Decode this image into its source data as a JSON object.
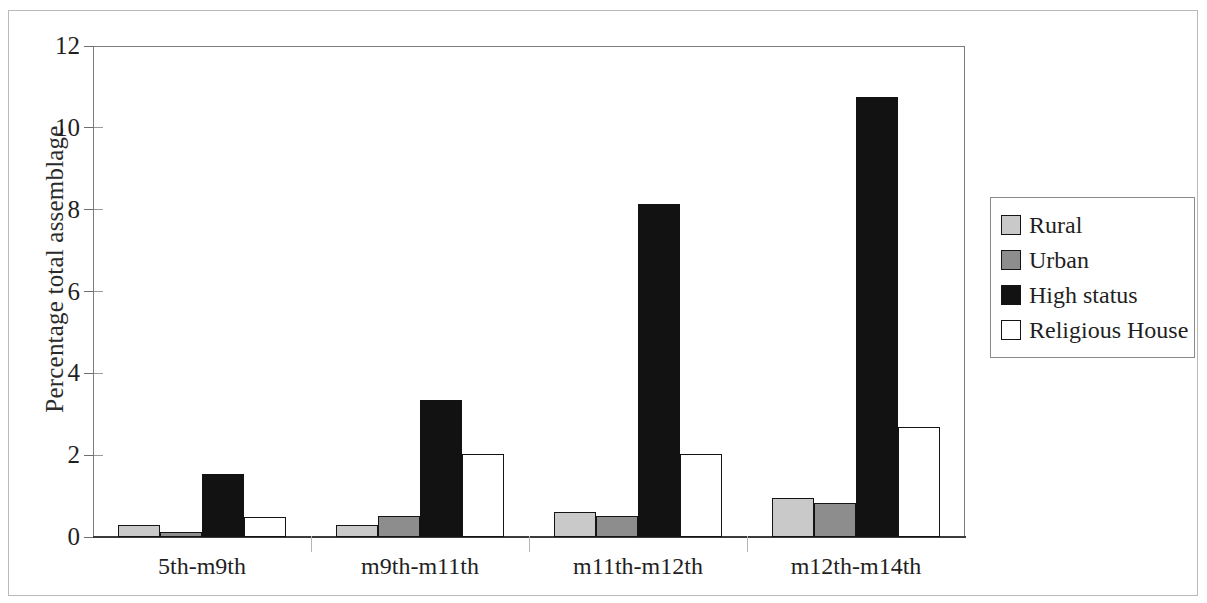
{
  "chart_data": {
    "type": "bar",
    "title": "",
    "subtitle": "",
    "xlabel": "",
    "ylabel": "Percentage total assemblage",
    "categories": [
      "5th-m9th",
      "m9th-m11th",
      "m11th-m12th",
      "m12th-m14th"
    ],
    "series": [
      {
        "name": "Rural",
        "color": "#c9c9c9",
        "values": [
          0.3,
          0.3,
          0.62,
          0.95
        ]
      },
      {
        "name": "Urban",
        "color": "#8d8d8d",
        "values": [
          0.12,
          0.52,
          0.52,
          0.82
        ]
      },
      {
        "name": "High status",
        "color": "#121212",
        "values": [
          1.55,
          3.35,
          8.15,
          10.75
        ]
      },
      {
        "name": "Religious House",
        "color": "#ffffff",
        "values": [
          0.5,
          2.02,
          2.03,
          2.68
        ]
      }
    ],
    "ylim": [
      0,
      12
    ],
    "ytick_values": [
      0,
      2,
      4,
      6,
      8,
      10,
      12
    ],
    "ytick_labels": [
      "0",
      "2",
      "4",
      "6",
      "8",
      "10",
      "12"
    ],
    "grid": false,
    "legend_position": "right",
    "legend_entries": [
      "Rural",
      "Urban",
      "High status",
      "Religious House"
    ]
  },
  "axes": {
    "y_title": "Percentage total assemblage"
  },
  "legend": {
    "items": [
      {
        "label": "Rural"
      },
      {
        "label": "Urban"
      },
      {
        "label": "High status"
      },
      {
        "label": "Religious House"
      }
    ]
  }
}
